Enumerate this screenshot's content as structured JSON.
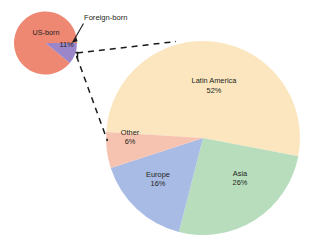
{
  "figure": {
    "background": "#ffffff",
    "label_color": "#231f20",
    "callout_line_color": "#1a1a1a"
  },
  "small_pie": {
    "name": "us-population-by-nativity",
    "center": {
      "x": 45.5,
      "y": 43.0
    },
    "radius": 31.5,
    "labels": {
      "us_born": "US-born",
      "foreign_born": "Foreign-born",
      "foreign_born_pct": "11%"
    },
    "slices": [
      {
        "key": "us_born",
        "label": "US-born",
        "value": 89,
        "display": "",
        "color": "#ee8873"
      },
      {
        "key": "foreign_born",
        "label": "Foreign-born",
        "value": 11,
        "display": "11%",
        "color": "#9b86c9"
      }
    ]
  },
  "big_pie": {
    "name": "foreign-born-by-region-of-origin",
    "center": {
      "x": 203.0,
      "y": 138.0
    },
    "radius": 97.0,
    "slices": [
      {
        "key": "latin_america",
        "label": "Latin America",
        "value": 52,
        "display": "52%",
        "color": "#fbe6bf"
      },
      {
        "key": "asia",
        "label": "Asia",
        "value": 26,
        "display": "26%",
        "color": "#b7ddbd"
      },
      {
        "key": "europe",
        "label": "Europe",
        "value": 16,
        "display": "16%",
        "color": "#a8bbe4"
      },
      {
        "key": "other",
        "label": "Other",
        "value": 6,
        "display": "6%",
        "color": "#f6c3b0"
      }
    ]
  },
  "chart_data": {
    "type": "pie",
    "title": "",
    "subtitle": "",
    "xlabel": "",
    "ylabel": "",
    "legend_position": "none",
    "grid": false,
    "charts": [
      {
        "name": "US population by nativity",
        "type": "pie",
        "categories": [
          "US-born",
          "Foreign-born"
        ],
        "values": [
          89,
          11
        ],
        "labels_shown": [
          "US-born",
          "11%"
        ],
        "colors": [
          "#ee8873",
          "#9b86c9"
        ],
        "units": "percent",
        "start_angle_deg": 0,
        "direction": "clockwise"
      },
      {
        "name": "Foreign-born population by region of origin",
        "type": "pie",
        "categories": [
          "Latin America",
          "Asia",
          "Europe",
          "Other"
        ],
        "values": [
          52,
          26,
          16,
          6
        ],
        "labels_shown": [
          "Latin America 52%",
          "Asia 26%",
          "Europe 16%",
          "Other 6%"
        ],
        "colors": [
          "#fbe6bf",
          "#b7ddbd",
          "#a8bbe4",
          "#f6c3b0"
        ],
        "units": "percent",
        "start_angle_deg": 0,
        "direction": "clockwise",
        "exploded_from": "Foreign-born"
      }
    ],
    "annotations": [
      {
        "text": "Foreign-born",
        "points_to": "11% slice of small pie"
      },
      {
        "text": "11%",
        "role": "slice value label"
      },
      {
        "text": "Latin America",
        "role": "slice label"
      },
      {
        "text": "52%",
        "role": "slice value label"
      },
      {
        "text": "Asia",
        "role": "slice label"
      },
      {
        "text": "26%",
        "role": "slice value label"
      },
      {
        "text": "Europe",
        "role": "slice label"
      },
      {
        "text": "16%",
        "role": "slice value label"
      },
      {
        "text": "Other",
        "role": "slice label"
      },
      {
        "text": "6%",
        "role": "slice value label"
      },
      {
        "text": "US-born",
        "role": "slice label"
      }
    ]
  }
}
